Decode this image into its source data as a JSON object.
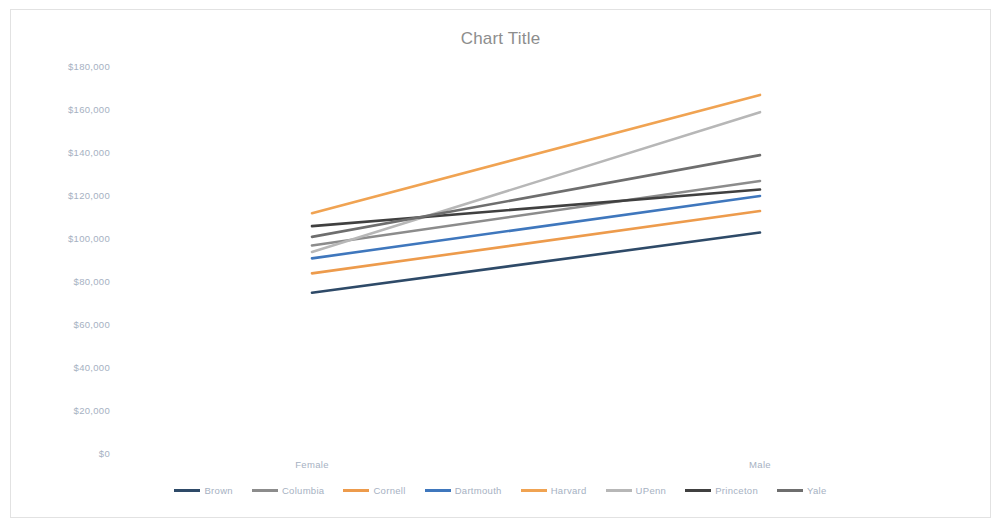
{
  "chart_data": {
    "type": "line",
    "title": "Chart Title",
    "xlabel": "",
    "ylabel": "",
    "categories": [
      "Female",
      "Male"
    ],
    "ylim": [
      0,
      180000
    ],
    "ytick_labels": [
      "$180,000",
      "$160,000",
      "$140,000",
      "$120,000",
      "$100,000",
      "$80,000",
      "$60,000",
      "$40,000",
      "$20,000",
      "$0"
    ],
    "ytick_values": [
      180000,
      160000,
      140000,
      120000,
      100000,
      80000,
      60000,
      40000,
      20000,
      0
    ],
    "grid": false,
    "legend_position": "bottom",
    "series": [
      {
        "name": "Brown",
        "color": "#2e4a68",
        "values": [
          75000,
          103000
        ]
      },
      {
        "name": "Columbia",
        "color": "#8c8c8c",
        "values": [
          97000,
          127000
        ]
      },
      {
        "name": "Cornell",
        "color": "#ed9b4c",
        "values": [
          84000,
          113000
        ]
      },
      {
        "name": "Dartmouth",
        "color": "#3f77bd",
        "values": [
          91000,
          120000
        ]
      },
      {
        "name": "Harvard",
        "color": "#f0a352",
        "values": [
          112000,
          167000
        ]
      },
      {
        "name": "UPenn",
        "color": "#b7b7b7",
        "values": [
          94000,
          159000
        ]
      },
      {
        "name": "Princeton",
        "color": "#404040",
        "values": [
          106000,
          123000
        ]
      },
      {
        "name": "Yale",
        "color": "#6e6e6e",
        "values": [
          101000,
          139000
        ]
      }
    ]
  },
  "axis": {
    "label_color": "#a6b1c2"
  }
}
